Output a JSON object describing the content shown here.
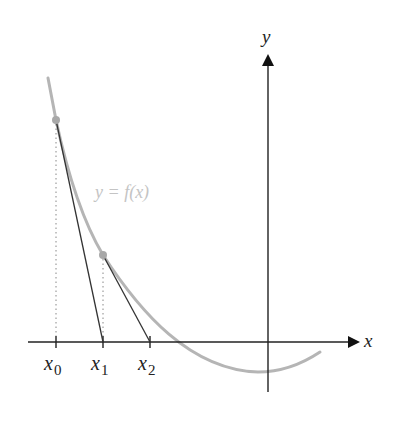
{
  "figure": {
    "axes": {
      "x_label": "x",
      "y_label": "y"
    },
    "curve_label": "y = f(x)",
    "ticks": [
      {
        "base": "x",
        "sub": "0"
      },
      {
        "base": "x",
        "sub": "1"
      },
      {
        "base": "x",
        "sub": "2"
      }
    ],
    "colors": {
      "axis": "#222222",
      "curve": "#b5b5b5",
      "tangent": "#333333",
      "point": "#a8a8a8",
      "guide": "#888888",
      "curve_label": "#c4c4c4"
    }
  }
}
